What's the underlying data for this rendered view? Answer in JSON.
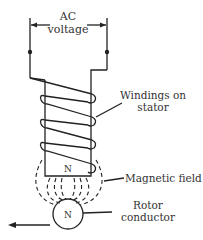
{
  "diagram": {
    "labels": {
      "ac_line1": "AC",
      "ac_line2": "voltage",
      "windings_line1": "Windings on",
      "windings_line2": "stator",
      "magnetic_field": "Magnetic field",
      "rotor_line1": "Rotor",
      "rotor_line2": "conductor",
      "stator_pole": "N",
      "rotor_pole": "N"
    },
    "colors": {
      "stroke": "#222222",
      "text": "#333333",
      "background": "#ffffff"
    }
  }
}
